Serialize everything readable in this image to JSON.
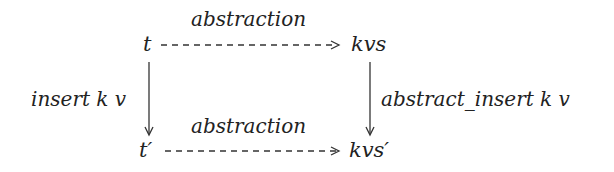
{
  "diagram": {
    "type": "commutative-square",
    "nodes": {
      "top_left": "t",
      "top_right": "kvs",
      "bottom_left": "t′",
      "bottom_right": "kvs′"
    },
    "edges": {
      "top": {
        "label": "abstraction",
        "from": "t",
        "to": "kvs",
        "style": "dashed"
      },
      "bottom": {
        "label": "abstraction",
        "from": "t′",
        "to": "kvs′",
        "style": "dashed"
      },
      "left": {
        "label": "insert k v",
        "from": "t",
        "to": "t′",
        "style": "solid"
      },
      "right": {
        "label": "abstract_insert k v",
        "from": "kvs",
        "to": "kvs′",
        "style": "solid"
      }
    },
    "colors": {
      "ink": "#222222",
      "background": "#ffffff"
    }
  }
}
